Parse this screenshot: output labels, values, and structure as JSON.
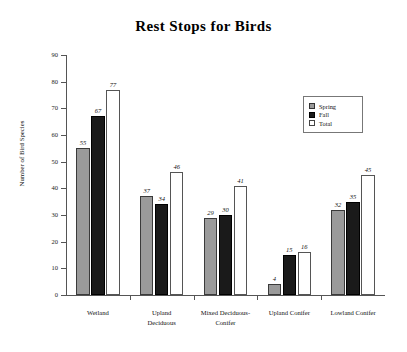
{
  "chart_data": {
    "type": "bar",
    "title": "Rest Stops for Birds",
    "xlabel": "",
    "ylabel": "Number of Bird Species",
    "ylim": [
      0,
      90
    ],
    "ytick_step": 10,
    "yticks": [
      0,
      10,
      20,
      30,
      40,
      50,
      60,
      70,
      80,
      90
    ],
    "grid": false,
    "legend_position": "top-right",
    "data_labels": true,
    "categories": [
      "Wetland",
      "Upland Deciduous",
      "Mixed Deciduous-Conifer",
      "Upland Conifer",
      "Lowland Conifer"
    ],
    "category_lines": [
      [
        "Wetland"
      ],
      [
        "Upland",
        "Deciduous"
      ],
      [
        "Mixed Deciduous-",
        "Conifer"
      ],
      [
        "Upland Conifer"
      ],
      [
        "Lowland Conifer"
      ]
    ],
    "series": [
      {
        "name": "Spring",
        "color": "#9a9a9a",
        "values": [
          55,
          37,
          29,
          4,
          32
        ]
      },
      {
        "name": "Fall",
        "color": "#1a1a1a",
        "values": [
          67,
          34,
          30,
          15,
          35
        ]
      },
      {
        "name": "Total",
        "color": "#ffffff",
        "values": [
          77,
          46,
          41,
          16,
          45
        ]
      }
    ]
  },
  "legend": {
    "items": [
      {
        "label": "Spring",
        "swatch": "spring"
      },
      {
        "label": "Fall",
        "swatch": "fall"
      },
      {
        "label": "Total",
        "swatch": "total"
      }
    ]
  }
}
